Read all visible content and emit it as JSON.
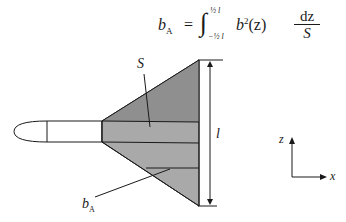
{
  "formula": {
    "lhs_symbol": "b",
    "lhs_subscript": "A",
    "equals": "=",
    "integral_sign": "∫",
    "upper_limit": "½ l",
    "lower_limit": "−½ l",
    "integrand_base": "b",
    "integrand_power": "2",
    "integrand_arg": "(z)",
    "fraction_numerator": "dz",
    "fraction_denominator": "S"
  },
  "labels": {
    "area": "S",
    "span": "l",
    "mean_chord_symbol": "b",
    "mean_chord_subscript": "A",
    "axis_vertical": "z",
    "axis_horizontal": "x"
  },
  "colors": {
    "wing_dark": "#8f8f8f",
    "wing_mid": "#a9a9a9",
    "body_fill": "#ffffff",
    "stroke": "#1a1a1a"
  }
}
